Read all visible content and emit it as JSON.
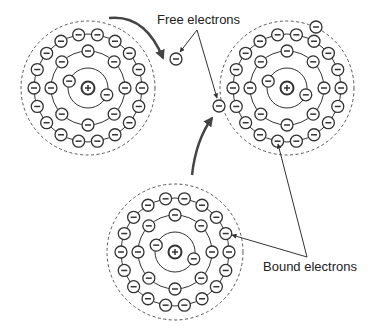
{
  "labels": {
    "free_electrons": "Free electrons",
    "bound_electrons": "Bound electrons"
  },
  "glyphs": {
    "electron": "−",
    "nucleus": "+"
  },
  "colors": {
    "stroke": "#333333",
    "dashed": "#555555",
    "arrow": "#444444",
    "background": "#ffffff"
  },
  "atoms": [
    {
      "id": "atom-top-left",
      "cx": 88,
      "cy": 88,
      "dashed_r": 67,
      "shells": [
        {
          "r": 20,
          "count": 2,
          "offset": 200
        },
        {
          "r": 37,
          "count": 8,
          "offset": 270
        },
        {
          "r": 54,
          "count": 18,
          "offset": 260
        }
      ]
    },
    {
      "id": "atom-top-right",
      "cx": 287,
      "cy": 88,
      "dashed_r": 67,
      "shells": [
        {
          "r": 20,
          "count": 2,
          "offset": 200
        },
        {
          "r": 37,
          "count": 8,
          "offset": 270
        },
        {
          "r": 54,
          "count": 18,
          "offset": 260
        }
      ]
    },
    {
      "id": "atom-bottom",
      "cx": 175,
      "cy": 252,
      "dashed_r": 68,
      "shells": [
        {
          "r": 20,
          "count": 2,
          "offset": 200
        },
        {
          "r": 37,
          "count": 8,
          "offset": 270
        },
        {
          "r": 54,
          "count": 18,
          "offset": 260
        }
      ]
    }
  ],
  "free_electrons": [
    {
      "x": 176,
      "y": 59
    },
    {
      "x": 219,
      "y": 106
    },
    {
      "x": 316,
      "y": 27
    }
  ],
  "curved_arrows": [
    {
      "from": [
        109,
        18
      ],
      "ctrl": [
        145,
        14
      ],
      "to": [
        163,
        58
      ]
    },
    {
      "from": [
        192,
        175
      ],
      "ctrl": [
        196,
        140
      ],
      "to": [
        212,
        118
      ]
    }
  ],
  "pointer_lines": [
    {
      "from": [
        197,
        30
      ],
      "to": [
        180,
        52
      ]
    },
    {
      "from": [
        197,
        30
      ],
      "to": [
        217,
        98
      ]
    },
    {
      "from": [
        307,
        257
      ],
      "to": [
        278,
        144
      ]
    },
    {
      "from": [
        307,
        257
      ],
      "to": [
        232,
        235
      ]
    }
  ],
  "label_positions": {
    "free_electrons": {
      "x": 157,
      "y": 12
    },
    "bound_electrons": {
      "x": 263,
      "y": 259
    }
  }
}
